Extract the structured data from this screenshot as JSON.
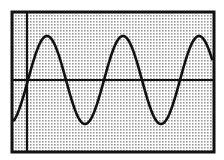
{
  "chart_data": {
    "type": "line",
    "title": "",
    "xlabel": "",
    "ylabel": "",
    "function": "sine",
    "amplitude": 1,
    "periods_visible": 2.5,
    "x": [
      0,
      0.25,
      0.5,
      0.75,
      1.0,
      1.25,
      1.5,
      1.75,
      2.0,
      2.25,
      2.5
    ],
    "y": [
      0,
      1,
      0,
      -1,
      0,
      1,
      0,
      -1,
      0,
      1,
      0
    ],
    "peaks_x_cycles": [
      0.25,
      1.25,
      2.25
    ],
    "troughs_x_cycles": [
      0.75,
      1.75
    ],
    "ylim": [
      -1.25,
      1.25
    ],
    "grid": false,
    "legend": null,
    "axes": {
      "x_axis_visible": true,
      "y_axis_visible": true,
      "tick_labels": []
    }
  },
  "style": {
    "frame_color": "#111111",
    "curve_color": "#111111",
    "axis_color": "#111111",
    "fill_dot_color": "#9a9a9a",
    "background_color": "#ffffff"
  },
  "geometry": {
    "frame": {
      "x": 12,
      "y": 12,
      "w": 202,
      "h": 140,
      "stroke": 3
    },
    "y_axis_x": 27,
    "x_axis_y": 80,
    "curve": {
      "x_start": 14,
      "x_end": 212,
      "zero_cross_x": 28,
      "period_px": 76,
      "amplitude_px": 44
    }
  }
}
